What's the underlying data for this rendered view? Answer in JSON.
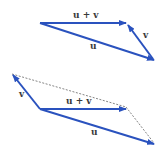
{
  "colors": {
    "vector": "#2a52be",
    "dotted": "#666666",
    "label": "#3a3a3a"
  },
  "top_diagram": {
    "sum_label": "u + v",
    "u_label": "u",
    "v_label": "v"
  },
  "bottom_diagram": {
    "sum_label": "u + v",
    "u_label": "u",
    "v_label": "v"
  }
}
